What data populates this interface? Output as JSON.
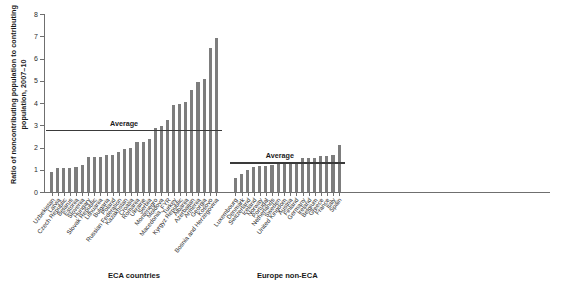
{
  "chart_data": {
    "type": "bar",
    "title": "",
    "xlabel": "",
    "ylabel": "Ratio of noncontributing population to contributing population, 2007–10",
    "ylim": [
      0,
      8
    ],
    "yticks": [
      0,
      1,
      2,
      3,
      4,
      5,
      6,
      7,
      8
    ],
    "ytick_labels": [
      "0",
      "1",
      "2",
      "3",
      "4",
      "5",
      "6",
      "7",
      "8"
    ],
    "grid": false,
    "legend": "none",
    "bar_color": "#7d7d7d",
    "line_color": "#3a3a3a",
    "groups": [
      {
        "name": "ECA countries",
        "label": "ECA countries",
        "average_label": "Average",
        "average": 2.8,
        "categories": [
          "Uzbekistan",
          "Latvia",
          "Czech Republic",
          "Belarus",
          "Estonia",
          "Slovenia",
          "Hungary",
          "Slovak Republic",
          "Lithuania",
          "Bulgaria",
          "Poland",
          "Russian Federation",
          "Kazakhstan",
          "Croatia",
          "Romania",
          "Ukraine",
          "Serbia",
          "Montenegro",
          "Moldova",
          "Macedonia, FYR",
          "Turkey",
          "Kyrgyz Republic",
          "Albania",
          "Azerbaijan",
          "Armenia",
          "Georgia",
          "Kosovo",
          "Bosnia and Herzegovina"
        ],
        "values": [
          0.88,
          1.07,
          1.08,
          1.08,
          1.12,
          1.22,
          1.57,
          1.59,
          1.59,
          1.66,
          1.67,
          1.81,
          1.93,
          1.99,
          2.27,
          2.27,
          2.37,
          2.87,
          2.97,
          3.25,
          3.92,
          3.97,
          4.06,
          4.57,
          4.95,
          5.08,
          6.48,
          6.92
        ]
      },
      {
        "name": "Europe non-ECA",
        "label": "Europe non-ECA",
        "average_label": "Average",
        "average": 1.35,
        "categories": [
          "Luxembourg",
          "Denmark",
          "Switzerland",
          "Iceland",
          "Norway",
          "Portugal",
          "Netherlands",
          "Sweden",
          "United Kingdom",
          "Austria",
          "Finland",
          "Germany",
          "Ireland",
          "Belgium",
          "Greece",
          "France",
          "Italy",
          "Spain"
        ],
        "values": [
          0.62,
          0.82,
          0.97,
          1.12,
          1.17,
          1.19,
          1.21,
          1.24,
          1.26,
          1.3,
          1.36,
          1.51,
          1.55,
          1.53,
          1.6,
          1.62,
          1.66,
          2.12
        ]
      }
    ]
  }
}
